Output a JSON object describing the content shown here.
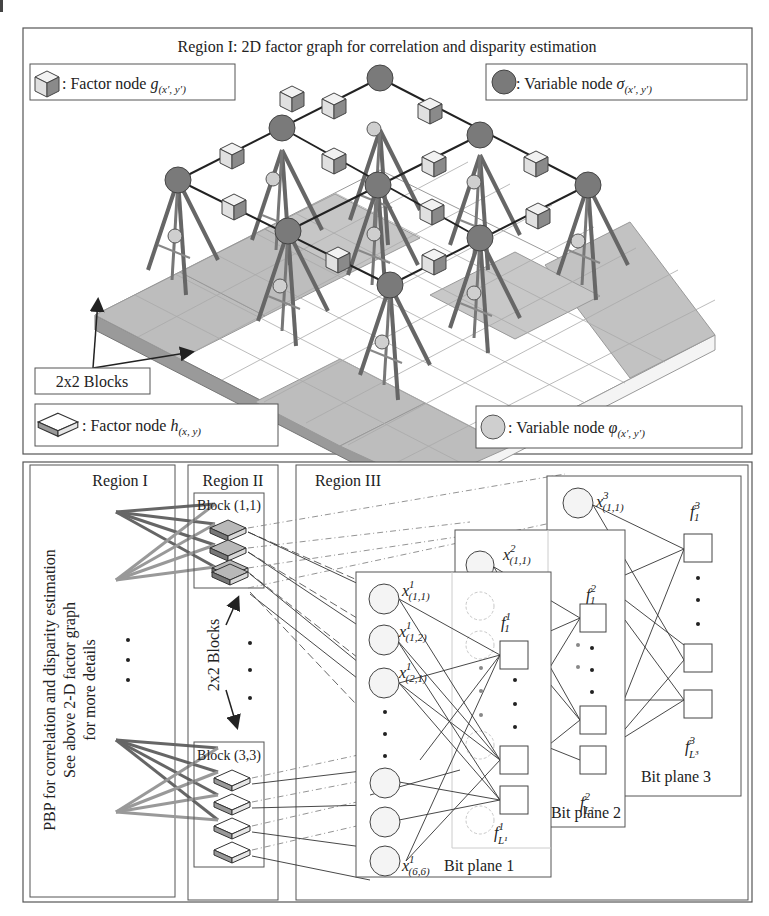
{
  "figure": {
    "top_panel": {
      "title": "Region I: 2D factor graph for correlation and disparity estimation",
      "legend": {
        "factor_g": {
          "prefix": ": Factor node ",
          "symbol": "g",
          "subscript": "(x′, y′)"
        },
        "variable_sigma": {
          "prefix": ": Variable node ",
          "symbol": "σ",
          "subscript": "(x′, y′)"
        },
        "factor_h": {
          "prefix": ": Factor node ",
          "symbol": "h",
          "subscript": "(x, y)"
        },
        "variable_phi": {
          "prefix": ": Variable node ",
          "symbol": "φ",
          "subscript": "(x′, y′)"
        }
      },
      "blocks_label": "2x2 Blocks"
    },
    "bottom_panel": {
      "region1": {
        "title": "Region I",
        "rotated_line1": "PBP for correlation and disparity estimation",
        "rotated_line2": "See above 2-D factor graph",
        "rotated_line3": "for more details"
      },
      "region2": {
        "title": "Region II",
        "block_top": "Block (1,1)",
        "block_bottom": "Block (3,3)",
        "blocks_label": "2x2 Blocks"
      },
      "region3": {
        "title": "Region III",
        "bit_plane_1": "Bit plane 1",
        "bit_plane_2": "Bit plane 2",
        "bit_plane_3": "Bit plane 3",
        "nodes": {
          "x11_1": {
            "base": "x",
            "sup": "1",
            "sub": "(1,1)"
          },
          "x12_1": {
            "base": "x",
            "sup": "1",
            "sub": "(1,2)"
          },
          "x21_1": {
            "base": "x",
            "sup": "1",
            "sub": "(2,1)"
          },
          "x66_1": {
            "base": "x",
            "sup": "1",
            "sub": "(6,6)"
          },
          "x11_2": {
            "base": "x",
            "sup": "2",
            "sub": "(1,1)"
          },
          "x11_3": {
            "base": "x",
            "sup": "3",
            "sub": "(1,1)"
          },
          "f1_1": {
            "base": "f",
            "sup": "1",
            "sub": "1"
          },
          "fL_1": {
            "base": "f",
            "sup": "1",
            "sub": "L¹"
          },
          "f1_2": {
            "base": "f",
            "sup": "2",
            "sub": "1"
          },
          "fL_2": {
            "base": "f",
            "sup": "2",
            "sub": "L²"
          },
          "f1_3": {
            "base": "f",
            "sup": "3",
            "sub": "1"
          },
          "fL_3": {
            "base": "f",
            "sup": "3",
            "sub": "L³"
          }
        }
      }
    },
    "colors": {
      "variable_sigma": "#7a7a7a",
      "variable_phi": "#cfcfcf",
      "factor_cube_light": "#e8e8e8",
      "factor_cube_dark": "#8a8a8a",
      "tile_shaded": "#bdbdbd",
      "tile_white": "#ffffff",
      "stroke": "#333333",
      "ghost": "#c8c8c8"
    }
  }
}
